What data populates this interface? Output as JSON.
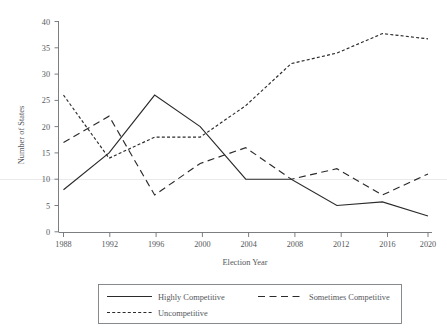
{
  "chart_data": {
    "type": "line",
    "title": "",
    "xlabel": "Election Year",
    "ylabel": "Number of States",
    "x": [
      1988,
      1992,
      1996,
      2000,
      2004,
      2008,
      2012,
      2016,
      2020
    ],
    "xtick_labels": [
      "1988",
      "1992",
      "1996",
      "2000",
      "2004",
      "2008",
      "2012",
      "2016",
      "2020"
    ],
    "ytick_labels": [
      "0",
      "5",
      "10",
      "15",
      "20",
      "25",
      "30",
      "35",
      "40"
    ],
    "yticks": [
      0,
      5,
      10,
      15,
      20,
      25,
      30,
      35,
      40
    ],
    "xlim": [
      1988,
      2020
    ],
    "ylim": [
      0,
      40
    ],
    "grid": "horizontal-single-at-10",
    "legend_position": "below-plot",
    "series": [
      {
        "name": "Highly Competitive",
        "dash": "solid",
        "values": [
          8,
          15,
          26,
          20,
          10,
          10,
          5,
          5.7,
          3
        ]
      },
      {
        "name": "Sometimes Competitive",
        "dash": "long-dash",
        "values": [
          17,
          22,
          7,
          13,
          16,
          10,
          12,
          7,
          11
        ]
      },
      {
        "name": "Uncompetitive",
        "dash": "short-dash",
        "values": [
          26,
          14,
          18,
          18,
          24,
          32,
          34,
          37.7,
          36.7
        ]
      }
    ]
  },
  "axes": {
    "y_title": "Number of States",
    "x_title": "Election Year",
    "y_ticks": [
      {
        "label": "40"
      },
      {
        "label": "35"
      },
      {
        "label": "30"
      },
      {
        "label": "25"
      },
      {
        "label": "20"
      },
      {
        "label": "15"
      },
      {
        "label": "10"
      },
      {
        "label": "5"
      },
      {
        "label": "0"
      }
    ],
    "x_ticks": [
      {
        "label": "1988"
      },
      {
        "label": "1992"
      },
      {
        "label": "1996"
      },
      {
        "label": "2000"
      },
      {
        "label": "2004"
      },
      {
        "label": "2008"
      },
      {
        "label": "2012"
      },
      {
        "label": "2016"
      },
      {
        "label": "2020"
      }
    ]
  },
  "legend": {
    "entries": [
      {
        "label": "Highly Competitive",
        "style": "solid"
      },
      {
        "label": "Sometimes Competitive",
        "style": "long-dash"
      },
      {
        "label": "Uncompetitive",
        "style": "short-dash"
      }
    ]
  },
  "colors": {
    "line": "#2b2b2b",
    "axis": "#6d7074",
    "text": "#55585c",
    "grid": "#e9e7ea",
    "background": "#ffffff"
  }
}
